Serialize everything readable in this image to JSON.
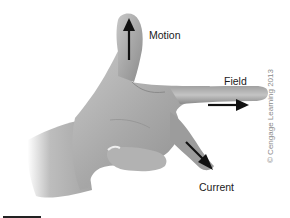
{
  "figure": {
    "labels": {
      "motion": "Motion",
      "field": "Field",
      "current": "Current"
    },
    "copyright": "© Cengage Learning 2013",
    "colors": {
      "background": "#ffffff",
      "skin_light": "#bdbdbd",
      "skin_mid": "#9a9a9a",
      "skin_dark": "#6e6e6e",
      "arrow": "#111111",
      "text": "#1a1a1a",
      "copyright_text": "#8a8a8a"
    },
    "arrows": [
      {
        "name": "motion",
        "direction": "up"
      },
      {
        "name": "field",
        "direction": "right"
      },
      {
        "name": "current",
        "direction": "down-right"
      }
    ]
  }
}
